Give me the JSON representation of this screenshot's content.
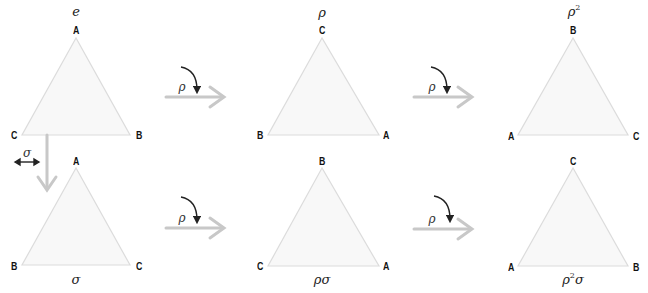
{
  "diagram": {
    "colors": {
      "triangle_fill": "#f8f8f8",
      "triangle_stroke": "#dcdcdc",
      "action_arrow": "#c8c8c8",
      "rotation_arrow": "#222222",
      "vertex_label": "#111111"
    },
    "triangles": [
      {
        "id": "e",
        "element": "e",
        "element_sup": "",
        "element_suffix": "",
        "top": "A",
        "left": "C",
        "right": "B",
        "label_position": "top"
      },
      {
        "id": "rho",
        "element": "ρ",
        "element_sup": "",
        "element_suffix": "",
        "top": "C",
        "left": "B",
        "right": "A",
        "label_position": "top"
      },
      {
        "id": "rho2",
        "element": "ρ",
        "element_sup": "2",
        "element_suffix": "",
        "top": "B",
        "left": "A",
        "right": "C",
        "label_position": "top"
      },
      {
        "id": "sigma",
        "element": "σ",
        "element_sup": "",
        "element_suffix": "",
        "top": "A",
        "left": "B",
        "right": "C",
        "label_position": "bottom"
      },
      {
        "id": "rhosigma",
        "element": "ρσ",
        "element_sup": "",
        "element_suffix": "",
        "top": "B",
        "left": "C",
        "right": "A",
        "label_position": "bottom"
      },
      {
        "id": "rho2sigma",
        "element": "ρ",
        "element_sup": "2",
        "element_suffix": "σ",
        "top": "C",
        "left": "A",
        "right": "B",
        "label_position": "bottom"
      }
    ],
    "arrows": [
      {
        "id": "top-1",
        "label": "ρ",
        "kind": "rotation"
      },
      {
        "id": "top-2",
        "label": "ρ",
        "kind": "rotation"
      },
      {
        "id": "bottom-1",
        "label": "ρ",
        "kind": "rotation"
      },
      {
        "id": "bottom-2",
        "label": "ρ",
        "kind": "rotation"
      },
      {
        "id": "down",
        "label": "σ",
        "kind": "reflection"
      }
    ]
  }
}
